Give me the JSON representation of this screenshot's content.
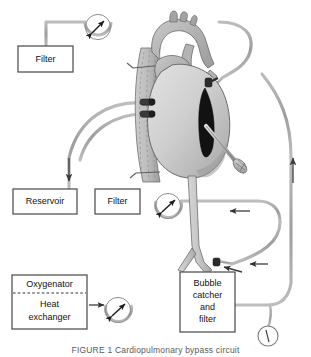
{
  "figure": {
    "caption": "FIGURE 1  Cardiopulmonary bypass circuit",
    "title": "Cardiopulmonary bypass circuit"
  },
  "colors": {
    "tubing": "#a9a9a9",
    "tubing_dark": "#8d8d8d",
    "outline": "#4a4a4a",
    "box_border": "#555555",
    "box_fill": "#ffffff",
    "text": "#111111",
    "heart_light": "#d8d8d8",
    "heart_mid": "#bdbdbd",
    "heart_dark": "#8f8f8f",
    "vessel": "#c6c6c6",
    "incision": "#1a1a1a",
    "cannula": "#3a3a3a",
    "arrow": "#3b3b3b",
    "caption_text": "#5a5a5a"
  },
  "components": [
    {
      "id": "filter-top",
      "label": "Filter",
      "lines": [
        "Filter"
      ],
      "x": 18,
      "y": 46,
      "w": 55,
      "h": 26
    },
    {
      "id": "reservoir",
      "label": "Reservoir",
      "lines": [
        "Reservoir"
      ],
      "x": 13,
      "y": 189,
      "w": 64,
      "h": 25
    },
    {
      "id": "filter-arterial",
      "label": "Filter",
      "lines": [
        "Filter"
      ],
      "x": 95,
      "y": 189,
      "w": 45,
      "h": 25
    },
    {
      "id": "oxygenator-heat-exchanger",
      "label": "Oxygenator / Heat exchanger",
      "lines": [
        "Oxygenator",
        "Heat",
        "exchanger"
      ],
      "x": 12,
      "y": 275,
      "w": 75,
      "h": 54,
      "divided": true
    },
    {
      "id": "bubble-catcher-filter",
      "label": "Bubble catcher and filter",
      "lines": [
        "Bubble",
        "catcher",
        "and",
        "filter"
      ],
      "x": 180,
      "y": 272,
      "w": 55,
      "h": 60
    }
  ],
  "pumps": [
    {
      "id": "pump-suction-top",
      "name": "roller-pump-suction",
      "cx": 98,
      "cy": 27,
      "r": 13
    },
    {
      "id": "pump-arterial",
      "name": "roller-pump-arterial",
      "cx": 168,
      "cy": 210,
      "r": 13
    },
    {
      "id": "pump-heat-exchanger",
      "name": "roller-pump-heat-exchanger",
      "cx": 118,
      "cy": 313,
      "r": 13
    }
  ],
  "gauge": {
    "id": "pressure-gauge",
    "name": "pressure-gauge",
    "cx": 268,
    "cy": 338,
    "r": 10
  },
  "arrows": [
    {
      "id": "arrow-venous-down",
      "name": "flow-arrow-venous-down",
      "x1": 69,
      "y1": 158,
      "x2": 69,
      "y2": 182,
      "dir": "down"
    },
    {
      "id": "arrow-return-up",
      "name": "flow-arrow-return-up",
      "x1": 293,
      "y1": 183,
      "x2": 293,
      "y2": 157,
      "dir": "up"
    },
    {
      "id": "arrow-arterial-left",
      "name": "flow-arrow-arterial-left",
      "x1": 250,
      "y1": 211,
      "x2": 228,
      "y2": 211,
      "dir": "left"
    },
    {
      "id": "arrow-femoral-left",
      "name": "flow-arrow-femoral-left",
      "x1": 268,
      "y1": 265,
      "x2": 248,
      "y2": 265,
      "dir": "left"
    },
    {
      "id": "arrow-femoral-in",
      "name": "flow-arrow-femoral-inflow",
      "x1": 240,
      "y1": 272,
      "x2": 221,
      "y2": 267,
      "dir": "left"
    },
    {
      "id": "arrow-oxy-out",
      "name": "flow-arrow-oxygenator-out",
      "x1": 88,
      "y1": 311,
      "x2": 105,
      "y2": 311,
      "dir": "right"
    }
  ],
  "anatomy": {
    "heart_label": "heart",
    "aorta_label": "aorta",
    "vena_cava_label": "vena cava",
    "venous_cannulas": 2,
    "vent_label": "ventricular vent",
    "femoral_cannula_label": "femoral arterial cannula"
  }
}
